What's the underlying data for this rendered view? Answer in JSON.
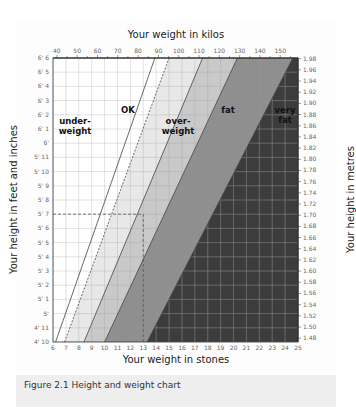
{
  "chart_data": {
    "type": "area",
    "title": "Height and weight chart",
    "caption": "Figure 2.1 Height and weight chart",
    "xlabel_bottom": "Your weight in stones",
    "xlabel_top": "Your weight in kilos",
    "ylabel_left": "Your height in feet and inches",
    "ylabel_right": "Your height in metres",
    "x_stones_ticks": [
      "6",
      "7",
      "8",
      "9",
      "10",
      "11",
      "12",
      "13",
      "14",
      "15",
      "16",
      "17",
      "18",
      "19",
      "20",
      "21",
      "22",
      "23",
      "24",
      "25"
    ],
    "x_kilos_ticks": [
      "40",
      "50",
      "60",
      "70",
      "80",
      "90",
      "100",
      "110",
      "120",
      "130",
      "140",
      "150"
    ],
    "y_feet_ticks": [
      "4' 10",
      "4' 11",
      "5'",
      "5' 1",
      "5' 2",
      "5' 3",
      "5' 4",
      "5' 5",
      "5' 6",
      "5' 7",
      "5' 8",
      "5' 9",
      "5' 10",
      "5' 11",
      "6'",
      "6' 1",
      "6' 2",
      "6' 3",
      "6' 4",
      "6' 5",
      "6' 6"
    ],
    "y_metres_ticks": [
      "1.48",
      "1.50",
      "1.52",
      "1.54",
      "1.56",
      "1.58",
      "1.60",
      "1.62",
      "1.64",
      "1.66",
      "1.68",
      "1.70",
      "1.72",
      "1.74",
      "1.76",
      "1.78",
      "1.80",
      "1.82",
      "1.84",
      "1.86",
      "1.88",
      "1.90",
      "1.92",
      "1.94",
      "1.96",
      "1.98"
    ],
    "xlim_stones": [
      6,
      25
    ],
    "ylim_inches": [
      58,
      78
    ],
    "grid": true,
    "bands": [
      {
        "name": "under-weight",
        "color": "#ffffff",
        "boundary_stones_at_4ft10": 6.2,
        "boundary_stones_at_6ft6": 13.9
      },
      {
        "name": "OK",
        "color": "#e8e8e8",
        "boundary_stones_at_4ft10": 6.9,
        "boundary_stones_at_6ft6": 15.0
      },
      {
        "name": "over-weight",
        "color": "#c9c9c9",
        "boundary_stones_at_4ft10": 8.4,
        "boundary_stones_at_6ft6": 17.6
      },
      {
        "name": "fat",
        "color": "#8f8f8f",
        "boundary_stones_at_4ft10": 10.0,
        "boundary_stones_at_6ft6": 20.3
      },
      {
        "name": "very fat",
        "color": "#3c3c3c",
        "boundary_stones_at_4ft10": 13.3,
        "boundary_stones_at_6ft6": 24.6
      }
    ],
    "example_marker": {
      "height": "5' 7",
      "weight_stones": 13,
      "style": "dashed"
    }
  }
}
